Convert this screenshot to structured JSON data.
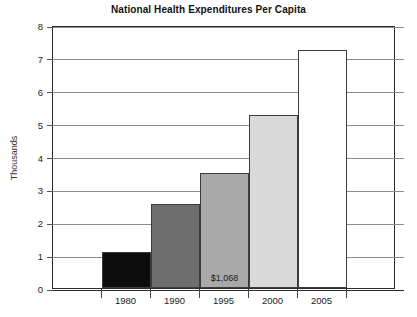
{
  "chart_data": {
    "type": "bar",
    "title": "National Health Expenditures Per Capita",
    "xlabel": "",
    "ylabel": "Thousands",
    "categories": [
      "1980",
      "1990",
      "1995",
      "2000",
      "2005"
    ],
    "values": [
      1.1,
      2.55,
      3.5,
      5.25,
      7.25
    ],
    "series": [
      {
        "name": "National Health Expenditures Per Capita",
        "values": [
          1.1,
          2.55,
          3.5,
          5.25,
          7.25
        ]
      }
    ],
    "bar_colors": [
      "#0d0d0d",
      "#6e6e6e",
      "#a9a9a9",
      "#d9d9d9",
      "#ffffff"
    ],
    "annotations": [
      {
        "category": "1995",
        "text": "$1,068"
      }
    ],
    "ylim": [
      0,
      8
    ],
    "ytick_labels": [
      "0",
      "1",
      "2",
      "3",
      "4",
      "5",
      "6",
      "7",
      "8"
    ],
    "ytick_values": [
      0,
      1,
      2,
      3,
      4,
      5,
      6,
      7,
      8
    ],
    "grid": true,
    "legend": false,
    "legend_position": "none"
  }
}
